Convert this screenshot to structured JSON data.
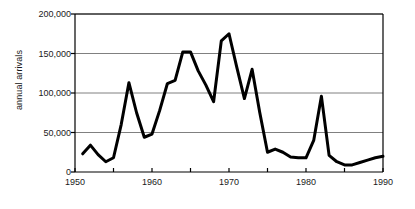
{
  "chart_data": {
    "type": "line",
    "title": "",
    "xlabel": "",
    "ylabel": "annual arrivals",
    "xlim": [
      1950,
      1990
    ],
    "ylim": [
      0,
      200000
    ],
    "grid": true,
    "legend": "none",
    "y_ticks": [
      0,
      50000,
      100000,
      150000,
      200000
    ],
    "y_tick_labels": [
      "0",
      "50,000",
      "100,000",
      "150,000",
      "200,000"
    ],
    "x_ticks": [
      1950,
      1960,
      1970,
      1980,
      1990
    ],
    "x_tick_labels": [
      "1950",
      "1960",
      "1970",
      "1980",
      "1990"
    ],
    "x_minor_ticks": [
      1955,
      1965,
      1975,
      1985
    ],
    "line_color": "#000000",
    "line_width": 3,
    "grid_color": "#808080",
    "axis_color": "#000000",
    "background_color": "#ffffff",
    "x": [
      1951,
      1952,
      1953,
      1954,
      1955,
      1956,
      1957,
      1958,
      1959,
      1960,
      1961,
      1962,
      1963,
      1964,
      1965,
      1966,
      1967,
      1968,
      1969,
      1970,
      1971,
      1972,
      1973,
      1974,
      1975,
      1976,
      1977,
      1978,
      1979,
      1980,
      1981,
      1982,
      1983,
      1984,
      1985,
      1986,
      1987,
      1988,
      1989,
      1990
    ],
    "values": [
      23000,
      34000,
      22000,
      13000,
      18000,
      60000,
      113000,
      75000,
      44000,
      48000,
      78000,
      112000,
      116000,
      152000,
      152000,
      128000,
      110000,
      89000,
      166000,
      175000,
      133000,
      93000,
      130000,
      75000,
      25000,
      29000,
      25000,
      19000,
      18000,
      18000,
      40000,
      96000,
      21000,
      13000,
      9000,
      9000,
      12000,
      15000,
      18000,
      20000
    ],
    "series_name": "annual arrivals",
    "notes": {
      "peak_1970": 175000,
      "peak_1969": 166000,
      "peak_1964_1965": 152000,
      "peak_1973": 130000,
      "peak_1957": 113000,
      "peak_1982": 96000,
      "min_1985_1986": 9000
    }
  },
  "axes": {
    "ylabel": "annual arrivals"
  }
}
